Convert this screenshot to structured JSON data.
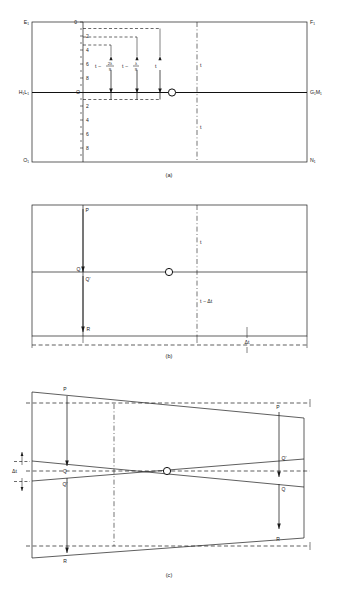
{
  "figure": {
    "title": "",
    "panels": [
      {
        "caption": "(a)",
        "corner_labels": {
          "top_left": "E₁",
          "top_right": "F₁",
          "mid_left": "H₁L₁",
          "mid_right": "G₁M₁",
          "bottom_left": "O₁",
          "bottom_right": "N₁",
          "origin_top": "0",
          "origin_mid": "O"
        },
        "scale_upper": [
          "0",
          "2",
          "4",
          "6",
          "8"
        ],
        "scale_lower": [
          "0",
          "2",
          "4",
          "6",
          "8"
        ],
        "measure_labels": [
          {
            "text": "t − 2λ/9",
            "base": "t −",
            "num": "2λ",
            "den": "9"
          },
          {
            "text": "t − λ/9",
            "base": "t −",
            "num": "λ",
            "den": "9"
          },
          {
            "text": "t",
            "base": "t",
            "num": "",
            "den": ""
          }
        ],
        "axis_labels": [
          "t",
          "t"
        ]
      },
      {
        "caption": "(b)",
        "point_labels": [
          "P",
          "Q",
          "Q'",
          "R"
        ],
        "measure_labels": [
          "t",
          "t − Δt",
          "Δt"
        ]
      },
      {
        "caption": "(c)",
        "point_labels_left": [
          "P",
          "Q",
          "Q'",
          "R"
        ],
        "point_labels_right": [
          "P",
          "Q'",
          "Q",
          "R"
        ],
        "measure_labels": [
          "Δt"
        ]
      }
    ]
  },
  "colors": {
    "ink": "#1a1a1a",
    "background": "#ffffff"
  }
}
